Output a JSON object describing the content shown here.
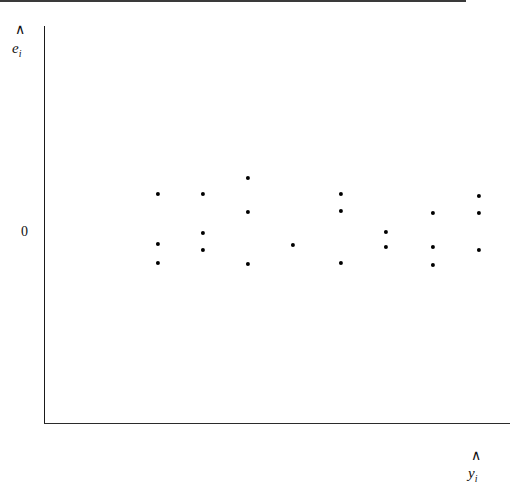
{
  "chart_data": {
    "type": "scatter",
    "title": "",
    "subtitle": "",
    "xlabel": "y-hat sub i",
    "ylabel": "e-hat sub i",
    "xlabel_glyph": "y",
    "xlabel_hat": "∧",
    "xlabel_sub": "i",
    "ylabel_glyph": "e",
    "ylabel_hat": "∧",
    "ylabel_sub": "i",
    "grid": false,
    "legend": null,
    "reference_line": {
      "name": "zero-line",
      "orientation": "horizontal",
      "value": 0,
      "label": "0"
    },
    "ytick_labels": [
      "0"
    ],
    "ytick_values": [
      0
    ],
    "xtick_labels": [],
    "xtick_values": [],
    "xlim": [
      0,
      100
    ],
    "ylim": [
      -40,
      60
    ],
    "annotation": "Residuals scattered randomly about zero with constant spread (homoscedastic).",
    "point_color": "#000000",
    "axis_color": "#1a1a1a",
    "line_color": "#3a3a3a",
    "background_color": "#ffffff",
    "n_points": 18,
    "points": [
      {
        "px": 158,
        "py": 194,
        "x": 24.5,
        "y": 20.4
      },
      {
        "px": 158,
        "py": 244,
        "x": 24.5,
        "y": -5.9
      },
      {
        "px": 158,
        "py": 263,
        "x": 24.5,
        "y": -15.9
      },
      {
        "px": 203,
        "py": 194,
        "x": 34.1,
        "y": 20.4
      },
      {
        "px": 203,
        "py": 233,
        "x": 34.1,
        "y": 0.0
      },
      {
        "px": 203,
        "py": 250,
        "x": 34.1,
        "y": -9.0
      },
      {
        "px": 248,
        "py": 178,
        "x": 43.8,
        "y": 28.8
      },
      {
        "px": 248,
        "py": 212,
        "x": 43.8,
        "y": 11.0
      },
      {
        "px": 248,
        "py": 264,
        "x": 43.8,
        "y": -16.4
      },
      {
        "px": 293,
        "py": 245,
        "x": 53.4,
        "y": -6.4
      },
      {
        "px": 341,
        "py": 194,
        "x": 63.7,
        "y": 20.4
      },
      {
        "px": 341,
        "py": 211,
        "x": 63.7,
        "y": 11.5
      },
      {
        "px": 341,
        "py": 263,
        "x": 63.7,
        "y": -15.9
      },
      {
        "px": 386,
        "py": 232,
        "x": 73.4,
        "y": 0.5
      },
      {
        "px": 386,
        "py": 247,
        "x": 73.4,
        "y": -7.4
      },
      {
        "px": 433,
        "py": 213,
        "x": 83.5,
        "y": 10.5
      },
      {
        "px": 433,
        "py": 247,
        "x": 83.5,
        "y": -7.4
      },
      {
        "px": 433,
        "py": 265,
        "x": 83.5,
        "y": -16.9
      },
      {
        "px": 479,
        "py": 196,
        "x": 93.3,
        "y": 19.3
      },
      {
        "px": 479,
        "py": 213,
        "x": 93.3,
        "y": 10.5
      },
      {
        "px": 479,
        "py": 250,
        "x": 93.3,
        "y": -9.0
      }
    ]
  }
}
